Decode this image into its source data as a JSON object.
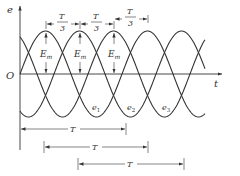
{
  "diagram": {
    "axes": {
      "y_label": "e",
      "x_label": "t",
      "origin_label": "O"
    },
    "waves": [
      {
        "name": "e1",
        "label": "e",
        "subscript": "1",
        "phase_deg": 0
      },
      {
        "name": "e2",
        "label": "e",
        "subscript": "2",
        "phase_deg": -120
      },
      {
        "name": "e3",
        "label": "e",
        "subscript": "3",
        "phase_deg": -240
      }
    ],
    "amplitude_label": {
      "main": "E",
      "subscript": "m"
    },
    "phase_spacing_label": {
      "numerator": "T",
      "denominator": "3"
    },
    "period_label": "T",
    "period_arrows_count": 3,
    "colors": {
      "line": "#333333",
      "background": "#ffffff"
    }
  }
}
